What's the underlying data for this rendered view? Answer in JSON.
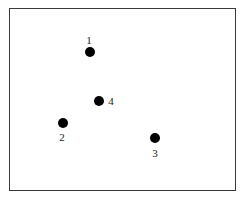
{
  "diagram": {
    "frame": {
      "border_color": "#3a3a3a",
      "background": "#ffffff"
    },
    "points": [
      {
        "label": "1",
        "x": 90,
        "y": 52,
        "label_x": 89,
        "label_y": 40
      },
      {
        "label": "2",
        "x": 63,
        "y": 123,
        "label_x": 62,
        "label_y": 137
      },
      {
        "label": "3",
        "x": 155,
        "y": 138,
        "label_x": 155,
        "label_y": 153
      },
      {
        "label": "4",
        "x": 99,
        "y": 101,
        "label_x": 111,
        "label_y": 101
      }
    ],
    "dot_color": "#000000"
  }
}
